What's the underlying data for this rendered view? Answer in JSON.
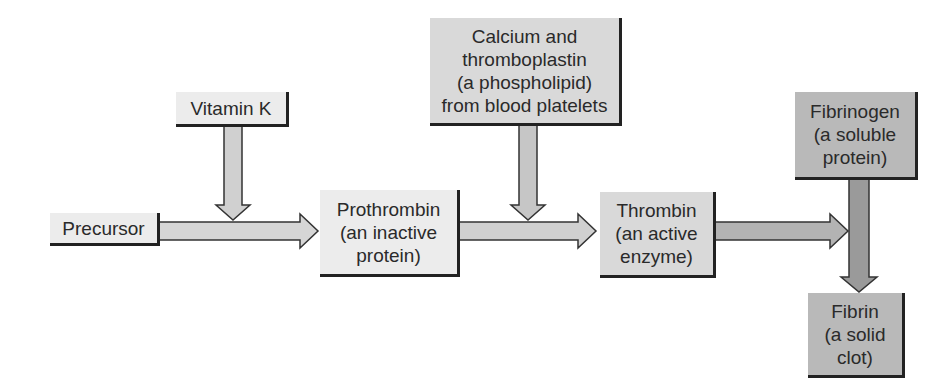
{
  "diagram": {
    "type": "flowchart",
    "title": "",
    "nodes": [
      {
        "id": "precursor",
        "lines": [
          "Precursor"
        ]
      },
      {
        "id": "vitamin_k",
        "lines": [
          "Vitamin K"
        ]
      },
      {
        "id": "prothrombin",
        "lines": [
          "Prothrombin",
          "(an inactive",
          "protein)"
        ]
      },
      {
        "id": "calcium",
        "lines": [
          "Calcium and",
          "thromboplastin",
          "(a phospholipid)",
          "from blood platelets"
        ]
      },
      {
        "id": "thrombin",
        "lines": [
          "Thrombin",
          "(an active",
          "enzyme)"
        ]
      },
      {
        "id": "fibrinogen",
        "lines": [
          "Fibrinogen",
          "(a soluble",
          "protein)"
        ]
      },
      {
        "id": "fibrin",
        "lines": [
          "Fibrin",
          "(a solid",
          "clot)"
        ]
      }
    ],
    "edges": [
      {
        "from": "precursor",
        "to": "prothrombin"
      },
      {
        "from": "vitamin_k",
        "to": "precursor->prothrombin"
      },
      {
        "from": "prothrombin",
        "to": "thrombin"
      },
      {
        "from": "calcium",
        "to": "prothrombin->thrombin"
      },
      {
        "from": "thrombin",
        "to": "fibrinogen->fibrin"
      },
      {
        "from": "fibrinogen",
        "to": "fibrin"
      }
    ],
    "colors": {
      "light_box": "#ececec",
      "mid_box": "#d9d9d9",
      "dark_box": "#b9b9b9",
      "arrow_light": "#d6d6d6",
      "arrow_mid": "#bdbdbd",
      "arrow_dark": "#9a9a9a",
      "outline": "#222222"
    }
  }
}
